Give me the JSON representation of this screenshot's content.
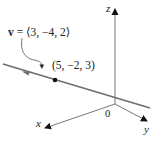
{
  "diagram": {
    "type": "3d-line-with-direction-vector",
    "vector_label": "v = ⟨3, −4, 2⟩",
    "vector_symbol": "v",
    "vector_components": "= ⟨3, −4, 2⟩",
    "point_label": "(5, −2, 3)",
    "axes": {
      "x": "x",
      "y": "y",
      "z": "z",
      "origin": "0"
    },
    "colors": {
      "line": "#6e6e6e",
      "axes": "#555555",
      "text": "#222222",
      "point": "#111111"
    }
  }
}
